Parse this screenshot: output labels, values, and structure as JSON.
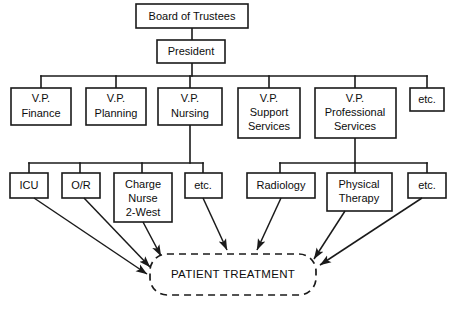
{
  "diagram": {
    "type": "organizational-chart",
    "title_present": false,
    "colors": {
      "background": "#ffffff",
      "stroke": "#1a1a1a",
      "text": "#0d0d0d",
      "box_fill": "#ffffff"
    },
    "levels": [
      {
        "level": 1,
        "nodes": [
          {
            "id": "board",
            "label": "Board of Trustees"
          }
        ]
      },
      {
        "level": 2,
        "nodes": [
          {
            "id": "president",
            "label": "President"
          }
        ]
      },
      {
        "level": 3,
        "nodes": [
          {
            "id": "vp-finance",
            "label_lines": [
              "V.P.",
              "Finance"
            ]
          },
          {
            "id": "vp-planning",
            "label_lines": [
              "V.P.",
              "Planning"
            ]
          },
          {
            "id": "vp-nursing",
            "label_lines": [
              "V.P.",
              "Nursing"
            ]
          },
          {
            "id": "vp-support",
            "label_lines": [
              "V.P.",
              "Support",
              "Services"
            ]
          },
          {
            "id": "vp-professional",
            "label_lines": [
              "V.P.",
              "Professional",
              "Services"
            ]
          },
          {
            "id": "vp-etc",
            "label_lines": [
              "etc."
            ]
          }
        ]
      },
      {
        "level": 4,
        "groups": [
          {
            "parent": "vp-nursing",
            "nodes": [
              {
                "id": "icu",
                "label_lines": [
                  "ICU"
                ]
              },
              {
                "id": "or",
                "label_lines": [
                  "O/R"
                ]
              },
              {
                "id": "charge-nurse",
                "label_lines": [
                  "Charge",
                  "Nurse",
                  "2-West"
                ]
              },
              {
                "id": "nursing-etc",
                "label_lines": [
                  "etc."
                ]
              }
            ]
          },
          {
            "parent": "vp-professional",
            "nodes": [
              {
                "id": "radiology",
                "label_lines": [
                  "Radiology"
                ]
              },
              {
                "id": "physical-therapy",
                "label_lines": [
                  "Physical",
                  "Therapy"
                ]
              },
              {
                "id": "professional-etc",
                "label_lines": [
                  "etc."
                ]
              }
            ]
          }
        ]
      }
    ],
    "outcome": {
      "id": "patient-treatment",
      "label": "PATIENT TREATMENT",
      "shape": "rounded-dashed",
      "incoming_from": [
        "icu",
        "or",
        "charge-nurse",
        "nursing-etc",
        "radiology",
        "physical-therapy",
        "professional-etc"
      ]
    }
  },
  "labels": {
    "board": "Board of Trustees",
    "president": "President",
    "vp_finance_1": "V.P.",
    "vp_finance_2": "Finance",
    "vp_planning_1": "V.P.",
    "vp_planning_2": "Planning",
    "vp_nursing_1": "V.P.",
    "vp_nursing_2": "Nursing",
    "vp_support_1": "V.P.",
    "vp_support_2": "Support",
    "vp_support_3": "Services",
    "vp_professional_1": "V.P.",
    "vp_professional_2": "Professional",
    "vp_professional_3": "Services",
    "vp_etc": "etc.",
    "icu": "ICU",
    "or": "O/R",
    "charge_1": "Charge",
    "charge_2": "Nurse",
    "charge_3": "2-West",
    "nursing_etc": "etc.",
    "radiology": "Radiology",
    "physical_1": "Physical",
    "physical_2": "Therapy",
    "professional_etc": "etc.",
    "patient_treatment": "PATIENT TREATMENT"
  }
}
